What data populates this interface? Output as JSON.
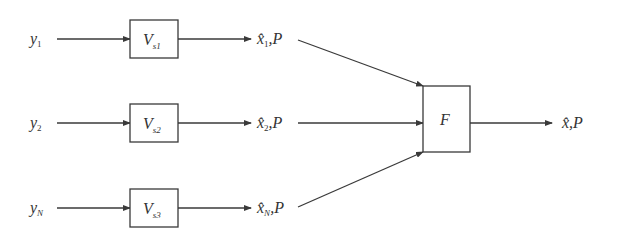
{
  "diagram": {
    "type": "block-diagram",
    "inputs": [
      {
        "symbol": "y",
        "sub": "1"
      },
      {
        "symbol": "y",
        "sub": "2"
      },
      {
        "symbol": "y",
        "sub": "N"
      }
    ],
    "filters": [
      {
        "symbol": "V",
        "sub": "s1"
      },
      {
        "symbol": "V",
        "sub": "s2"
      },
      {
        "symbol": "V",
        "sub": "s3"
      }
    ],
    "estimates": [
      {
        "symbol": "x̂",
        "sub": "1",
        "suffix": ",P"
      },
      {
        "symbol": "x̂",
        "sub": "2",
        "suffix": ",P"
      },
      {
        "symbol": "x̂",
        "sub": "N",
        "suffix": ",P"
      }
    ],
    "fusion": {
      "symbol": "F"
    },
    "output": {
      "symbol": "x̂",
      "suffix": ",P"
    },
    "colors": {
      "stroke": "#3a3a3a",
      "text": "#333333",
      "background": "#ffffff"
    }
  }
}
